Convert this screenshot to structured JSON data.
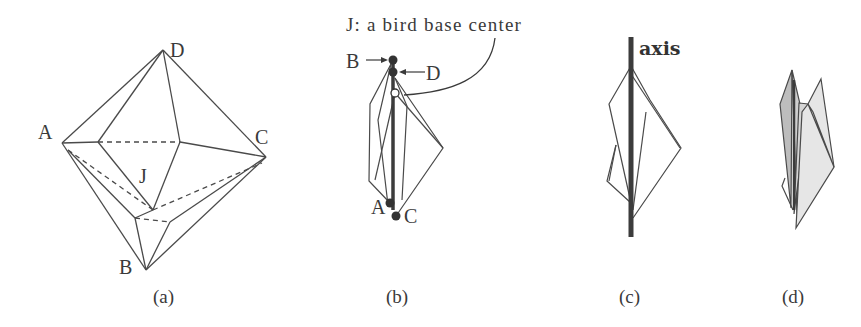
{
  "figure": {
    "panels": [
      {
        "id": "a",
        "caption": "(a)",
        "vertex_labels": {
          "A": "A",
          "B": "B",
          "C": "C",
          "D": "D",
          "J": "J"
        }
      },
      {
        "id": "b",
        "caption": "(b)",
        "annotation": "J: a bird base center",
        "vertex_labels": {
          "A": "A",
          "B": "B",
          "C": "C",
          "D": "D"
        }
      },
      {
        "id": "c",
        "caption": "(c)",
        "axis_label": "axis"
      },
      {
        "id": "d",
        "caption": "(d)"
      }
    ],
    "colors": {
      "line": "#4a4a4a",
      "axis": "#3c3c3c",
      "fill_dark": "#bdbdbd",
      "fill_light": "#e6e6e6",
      "dot": "#333333"
    }
  }
}
